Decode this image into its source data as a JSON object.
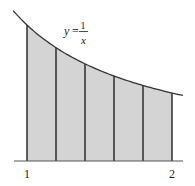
{
  "figure": {
    "curve_label": {
      "lhs": "y",
      "eq": "=",
      "num": "1",
      "den": "x"
    },
    "x_ticks": [
      {
        "value": 1,
        "label": "1"
      },
      {
        "value": 2,
        "label": "2"
      }
    ],
    "colors": {
      "fill": "#d4d4d4",
      "stroke": "#222222",
      "curve": "#333333"
    }
  },
  "chart_data": {
    "type": "area",
    "title": "",
    "function": "y = 1/x",
    "x_range": [
      1,
      2
    ],
    "partition": [
      1.0,
      1.2,
      1.4,
      1.6,
      1.8,
      2.0
    ],
    "subintervals": 5,
    "values_at_partition": [
      1.0,
      0.8333,
      0.7143,
      0.625,
      0.5556,
      0.5
    ],
    "xlabel": "",
    "ylabel": "",
    "tick_labels": [
      "1",
      "2"
    ],
    "grid": false
  }
}
